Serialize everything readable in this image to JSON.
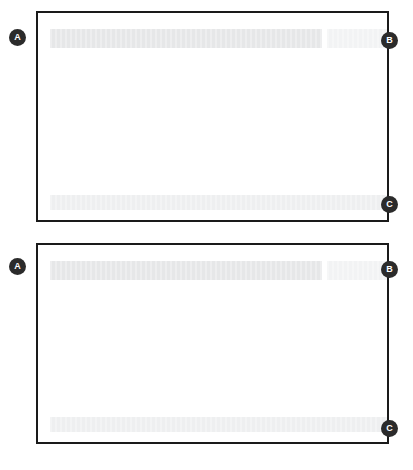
{
  "figure": {
    "type": "annotated-ui-screenshots",
    "background_color": "#ffffff",
    "panel_count": 2,
    "badge_color": "#2b2b2b",
    "badge_text_color": "#ffffff",
    "frame_color": "#1a1a1a"
  },
  "panels": [
    {
      "id": "panel-1",
      "frame": {
        "x": 36,
        "y": 11,
        "width": 353,
        "height": 211
      },
      "content": {
        "header_bar": {
          "label": "",
          "color": "#e6e7e8",
          "state": "redacted"
        },
        "header_bar_secondary": {
          "label": "",
          "color": "#f2f3f4",
          "state": "redacted"
        },
        "body_area": {
          "label": "",
          "color": "#ffffff",
          "state": "blank"
        },
        "footer_bar": {
          "label": "",
          "color": "#eeeff0",
          "state": "redacted"
        }
      },
      "callouts": [
        {
          "letter": "A",
          "position": "left-edge-top",
          "x": 9,
          "y": 29
        },
        {
          "letter": "B",
          "position": "right-edge-top",
          "x": 381,
          "y": 32
        },
        {
          "letter": "C",
          "position": "right-edge-bottom",
          "x": 381,
          "y": 196
        }
      ]
    },
    {
      "id": "panel-2",
      "frame": {
        "x": 36,
        "y": 243,
        "width": 353,
        "height": 201
      },
      "content": {
        "header_bar": {
          "label": "",
          "color": "#e6e7e8",
          "state": "redacted"
        },
        "header_bar_secondary": {
          "label": "",
          "color": "#f2f3f4",
          "state": "redacted"
        },
        "body_area": {
          "label": "",
          "color": "#ffffff",
          "state": "blank"
        },
        "footer_bar": {
          "label": "",
          "color": "#eeeff0",
          "state": "redacted"
        }
      },
      "callouts": [
        {
          "letter": "A",
          "position": "left-edge-top",
          "x": 9,
          "y": 258
        },
        {
          "letter": "B",
          "position": "right-edge-top",
          "x": 381,
          "y": 261
        },
        {
          "letter": "C",
          "position": "right-edge-bottom",
          "x": 381,
          "y": 420
        }
      ]
    }
  ]
}
